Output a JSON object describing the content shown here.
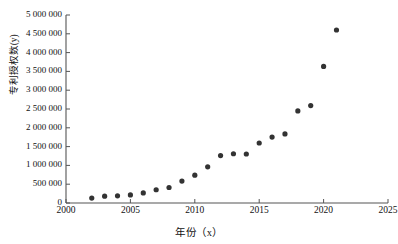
{
  "page": {
    "cut_text_left": "",
    "cut_text_right": ""
  },
  "chart_data": {
    "type": "scatter",
    "title": "",
    "xlabel": "年份（x）",
    "ylabel": "专利授权数(y)",
    "xlim": [
      2000,
      2025
    ],
    "ylim": [
      0,
      5000000
    ],
    "grid": false,
    "legend": null,
    "marker_color": "#333333",
    "axis_color": "#555555",
    "x_ticks": [
      2000,
      2005,
      2010,
      2015,
      2020,
      2025
    ],
    "x_tick_labels": [
      "2000",
      "2005",
      "2010",
      "2015",
      "2020",
      "2025"
    ],
    "y_ticks": [
      0,
      500000,
      1000000,
      1500000,
      2000000,
      2500000,
      3000000,
      3500000,
      4000000,
      4500000,
      5000000
    ],
    "y_tick_labels": [
      "0",
      "500 000",
      "1 000 000",
      "1 500 000",
      "2 000 000",
      "2 500 000",
      "3 000 000",
      "3 500 000",
      "4 000 000",
      "4 500 000",
      "5 000 000"
    ],
    "x": [
      2002,
      2003,
      2004,
      2005,
      2006,
      2007,
      2008,
      2009,
      2010,
      2011,
      2012,
      2013,
      2014,
      2015,
      2016,
      2017,
      2018,
      2019,
      2020,
      2021
    ],
    "values": [
      132000,
      182000,
      190000,
      215000,
      268000,
      352000,
      412000,
      582000,
      741000,
      961000,
      1260000,
      1310000,
      1303000,
      1596000,
      1754000,
      1836000,
      2448000,
      2590000,
      3633000,
      4601000
    ],
    "points": [
      {
        "x": 2002,
        "y": 132000
      },
      {
        "x": 2003,
        "y": 182000
      },
      {
        "x": 2004,
        "y": 190000
      },
      {
        "x": 2005,
        "y": 215000
      },
      {
        "x": 2006,
        "y": 268000
      },
      {
        "x": 2007,
        "y": 352000
      },
      {
        "x": 2008,
        "y": 412000
      },
      {
        "x": 2009,
        "y": 582000
      },
      {
        "x": 2010,
        "y": 741000
      },
      {
        "x": 2011,
        "y": 961000
      },
      {
        "x": 2012,
        "y": 1260000
      },
      {
        "x": 2013,
        "y": 1310000
      },
      {
        "x": 2014,
        "y": 1303000
      },
      {
        "x": 2015,
        "y": 1596000
      },
      {
        "x": 2016,
        "y": 1754000
      },
      {
        "x": 2017,
        "y": 1836000
      },
      {
        "x": 2018,
        "y": 2448000
      },
      {
        "x": 2019,
        "y": 2590000
      },
      {
        "x": 2020,
        "y": 3633000
      },
      {
        "x": 2021,
        "y": 4601000
      }
    ]
  }
}
